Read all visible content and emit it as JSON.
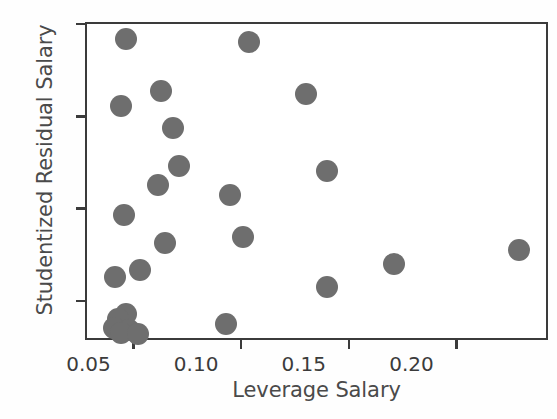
{
  "chart_data": {
    "type": "scatter",
    "title": "",
    "xlabel": "Leverage Salary",
    "ylabel": "Studentized Residual Salary",
    "xlim": [
      0.0275,
      0.2425
    ],
    "ylim": [
      -1.42,
      2.02
    ],
    "xticks": [
      0.05,
      0.1,
      0.15,
      0.2
    ],
    "xtick_labels": [
      "0.05",
      "0.10",
      "0.15",
      "0.20"
    ],
    "yticks": [
      2,
      1,
      0,
      -1
    ],
    "ytick_labels": [
      "2",
      "1",
      "0",
      "-1"
    ],
    "grid": false,
    "legend": null,
    "marker_color": "#6e6e6e",
    "marker_size": 22,
    "frame_color": "#3b3b3b",
    "background": "#ffffff",
    "n_points": 25,
    "points": [
      {
        "x": 0.0455,
        "y": 1.855
      },
      {
        "x": 0.1025,
        "y": 1.82
      },
      {
        "x": 0.0618,
        "y": 1.295
      },
      {
        "x": 0.1293,
        "y": 1.265
      },
      {
        "x": 0.0435,
        "y": 1.13
      },
      {
        "x": 0.0673,
        "y": 0.9
      },
      {
        "x": 0.07,
        "y": 0.485
      },
      {
        "x": 0.139,
        "y": 0.425
      },
      {
        "x": 0.0605,
        "y": 0.275
      },
      {
        "x": 0.094,
        "y": 0.175
      },
      {
        "x": 0.0445,
        "y": -0.045
      },
      {
        "x": 0.1,
        "y": -0.285
      },
      {
        "x": 0.0635,
        "y": -0.345
      },
      {
        "x": 0.228,
        "y": -0.425
      },
      {
        "x": 0.17,
        "y": -0.575
      },
      {
        "x": 0.052,
        "y": -0.645
      },
      {
        "x": 0.0405,
        "y": -0.72
      },
      {
        "x": 0.139,
        "y": -0.82
      },
      {
        "x": 0.0455,
        "y": -1.12
      },
      {
        "x": 0.042,
        "y": -1.175
      },
      {
        "x": 0.092,
        "y": -1.225
      },
      {
        "x": 0.04,
        "y": -1.265
      },
      {
        "x": 0.047,
        "y": -1.29
      },
      {
        "x": 0.0435,
        "y": -1.32
      },
      {
        "x": 0.051,
        "y": -1.33
      }
    ]
  }
}
